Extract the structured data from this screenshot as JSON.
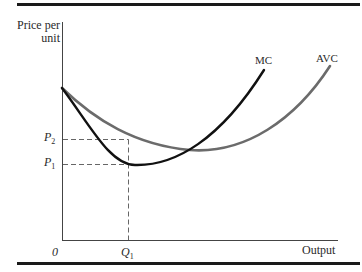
{
  "axes": {
    "y_label_line1": "Price per",
    "y_label_line2": "unit",
    "x_label": "Output",
    "origin": "0"
  },
  "ticks": {
    "p2": "P",
    "p2_sub": "2",
    "p1": "P",
    "p1_sub": "1",
    "q1": "Q",
    "q1_sub": "1"
  },
  "curves": {
    "mc": {
      "label": "MC",
      "color": "#111111"
    },
    "avc": {
      "label": "AVC",
      "color": "#6b6b6b"
    }
  },
  "colors": {
    "rule": "#1a1a1a",
    "axis": "#444444",
    "guide": "#555555"
  }
}
